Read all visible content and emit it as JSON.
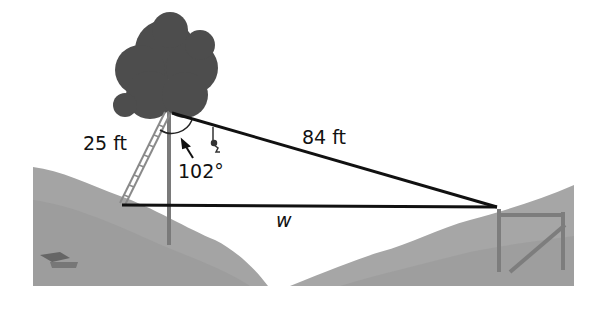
{
  "diagram": {
    "type": "triangle-word-problem",
    "labels": {
      "ladder_length": "25 ft",
      "zipline_length": "84 ft",
      "angle": "102°",
      "unknown_width": "w"
    },
    "triangle": {
      "vertices": {
        "tree_top": [
          169,
          130
        ],
        "ladder_base": [
          122,
          205
        ],
        "platform_top": [
          497,
          207
        ]
      },
      "sides": [
        {
          "from": "tree_top",
          "to": "ladder_base",
          "label": "25 ft"
        },
        {
          "from": "tree_top",
          "to": "platform_top",
          "label": "84 ft"
        },
        {
          "from": "ladder_base",
          "to": "platform_top",
          "label": "w"
        }
      ],
      "angle_at": "tree_top",
      "angle_value": "102°"
    },
    "colors": {
      "line": "#111111",
      "hill": "#a9a9a9",
      "hill_dark": "#8c8c8c",
      "tree_foliage": "#4a4a4a",
      "trunk": "#7a7a7a",
      "background": "#ffffff"
    }
  }
}
